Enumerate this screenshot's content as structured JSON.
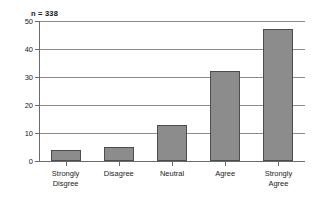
{
  "chart_data": {
    "type": "bar",
    "title": "",
    "subtitle": "",
    "xlabel": "",
    "ylabel": "",
    "annotation": "n = 338",
    "categories": [
      "Strongly Disgree",
      "Disagree",
      "Neutral",
      "Agree",
      "Strongly Agree"
    ],
    "category_lines": [
      [
        "Strongly",
        "Disgree"
      ],
      [
        "Disagree"
      ],
      [
        "Neutral"
      ],
      [
        "Agree"
      ],
      [
        "Strongly",
        "Agree"
      ]
    ],
    "values": [
      4,
      5,
      13,
      32,
      47
    ],
    "ylim": [
      0,
      50
    ],
    "yticks": [
      0,
      10,
      20,
      30,
      40,
      50
    ],
    "ytick_labels": [
      "0",
      "10",
      "20",
      "30",
      "40",
      "50"
    ],
    "grid": true,
    "grid_axis": "y",
    "legend": false,
    "legend_position": "none",
    "colors": {
      "bar_fill": "#8c8c8c",
      "bar_edge": "#4d4d4d",
      "grid": "#8a8a8a",
      "axis": "#6b6b6b",
      "text": "#222222",
      "background": "#ffffff"
    }
  }
}
